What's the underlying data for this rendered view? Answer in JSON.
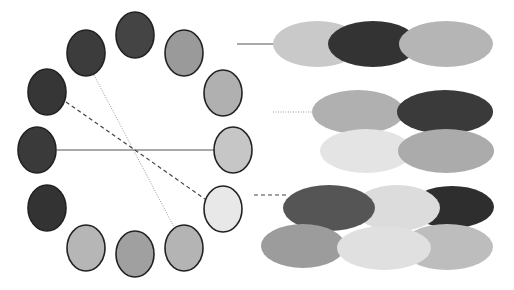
{
  "diagram": {
    "width": 514,
    "height": 290,
    "background": "#ffffff",
    "ring_circles": [
      {
        "id": "top",
        "cx": 135,
        "cy": 35,
        "rx": 19,
        "ry": 23,
        "fill": "#444444"
      },
      {
        "id": "top-right",
        "cx": 184,
        "cy": 53,
        "rx": 19,
        "ry": 23,
        "fill": "#9a9a9a"
      },
      {
        "id": "right-upper",
        "cx": 223,
        "cy": 93,
        "rx": 19,
        "ry": 23,
        "fill": "#b0b0b0"
      },
      {
        "id": "right",
        "cx": 233,
        "cy": 150,
        "rx": 19,
        "ry": 23,
        "fill": "#c6c6c6"
      },
      {
        "id": "right-lower",
        "cx": 223,
        "cy": 209,
        "rx": 19,
        "ry": 23,
        "fill": "#e8e8e8"
      },
      {
        "id": "bottom-right",
        "cx": 184,
        "cy": 248,
        "rx": 19,
        "ry": 23,
        "fill": "#b4b4b4"
      },
      {
        "id": "bottom",
        "cx": 135,
        "cy": 254,
        "rx": 19,
        "ry": 23,
        "fill": "#a0a0a0"
      },
      {
        "id": "bottom-left",
        "cx": 86,
        "cy": 248,
        "rx": 19,
        "ry": 23,
        "fill": "#b6b6b6"
      },
      {
        "id": "left-lower",
        "cx": 47,
        "cy": 208,
        "rx": 19,
        "ry": 23,
        "fill": "#333333"
      },
      {
        "id": "left",
        "cx": 37,
        "cy": 150,
        "rx": 19,
        "ry": 23,
        "fill": "#3a3a3a"
      },
      {
        "id": "left-upper",
        "cx": 47,
        "cy": 92,
        "rx": 19,
        "ry": 23,
        "fill": "#363636"
      },
      {
        "id": "upper-left",
        "cx": 86,
        "cy": 53,
        "rx": 19,
        "ry": 23,
        "fill": "#3c3c3c"
      }
    ],
    "connectors": [
      {
        "id": "solid-left-right",
        "style": "solid",
        "x1": 57,
        "y1": 150,
        "x2": 214,
        "y2": 150,
        "stroke": "#555555",
        "width": 1.2
      },
      {
        "id": "dashed-leftupper-rightlower",
        "style": "dashed",
        "x1": 66,
        "y1": 102,
        "x2": 205,
        "y2": 199,
        "stroke": "#444444",
        "width": 1.2
      },
      {
        "id": "dotted-upperleft-bottomright",
        "style": "dotted",
        "x1": 94,
        "y1": 75,
        "x2": 174,
        "y2": 227,
        "stroke": "#999999",
        "width": 1
      }
    ],
    "groups": [
      {
        "id": "group-solid",
        "lead": {
          "style": "solid",
          "x1": 237,
          "y1": 44,
          "x2": 275,
          "y2": 44,
          "stroke": "#555555",
          "width": 1.2
        },
        "ellipses": [
          {
            "cx": 317,
            "cy": 44,
            "rx": 44,
            "ry": 23,
            "fill": "#c9c9c9"
          },
          {
            "cx": 373,
            "cy": 44,
            "rx": 45,
            "ry": 23,
            "fill": "#333333"
          },
          {
            "cx": 446,
            "cy": 44,
            "rx": 47,
            "ry": 23,
            "fill": "#b5b5b5"
          }
        ]
      },
      {
        "id": "group-dotted",
        "lead": {
          "style": "dotted",
          "x1": 273,
          "y1": 112,
          "x2": 313,
          "y2": 112,
          "stroke": "#999999",
          "width": 1
        },
        "ellipses": [
          {
            "cx": 358,
            "cy": 112,
            "rx": 46,
            "ry": 22,
            "fill": "#b0b0b0"
          },
          {
            "cx": 445,
            "cy": 112,
            "rx": 48,
            "ry": 22,
            "fill": "#3a3a3a"
          },
          {
            "cx": 366,
            "cy": 151,
            "rx": 46,
            "ry": 22,
            "fill": "#e4e4e4"
          },
          {
            "cx": 446,
            "cy": 151,
            "rx": 48,
            "ry": 22,
            "fill": "#ababab"
          }
        ]
      },
      {
        "id": "group-dashed",
        "lead": {
          "style": "dashed",
          "x1": 254,
          "y1": 195,
          "x2": 288,
          "y2": 195,
          "stroke": "#444444",
          "width": 1.2
        },
        "ellipses": [
          {
            "cx": 452,
            "cy": 207,
            "rx": 42,
            "ry": 21,
            "fill": "#2e2e2e"
          },
          {
            "cx": 397,
            "cy": 208,
            "rx": 43,
            "ry": 23,
            "fill": "#dcdcdc"
          },
          {
            "cx": 329,
            "cy": 208,
            "rx": 46,
            "ry": 23,
            "fill": "#555555"
          },
          {
            "cx": 303,
            "cy": 246,
            "rx": 42,
            "ry": 22,
            "fill": "#9c9c9c"
          },
          {
            "cx": 447,
            "cy": 247,
            "rx": 46,
            "ry": 23,
            "fill": "#bdbdbd"
          },
          {
            "cx": 384,
            "cy": 248,
            "rx": 47,
            "ry": 22,
            "fill": "#e0e0e0"
          }
        ]
      }
    ]
  }
}
